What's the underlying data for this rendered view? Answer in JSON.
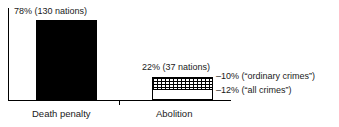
{
  "chart_data": {
    "type": "bar",
    "title": "",
    "subtitle": "",
    "xlabel": "",
    "ylabel": "",
    "ylim": [
      0,
      100
    ],
    "grid": false,
    "legend": "none",
    "categories": [
      "Death penalty",
      "Abolition"
    ],
    "values": [
      78,
      22
    ],
    "units": "percent",
    "series": [
      {
        "name": "Share of nations",
        "values": [
          78,
          22
        ],
        "counts": [
          130,
          37
        ],
        "data_labels": [
          "78% (130 nations)",
          "22% (37 nations)"
        ]
      }
    ],
    "segments": [
      {
        "category": "Abolition",
        "name": "ordinary crimes",
        "value": 10,
        "fill": "crosshatch",
        "annotation": "–10% (“ordinary crimes”)"
      },
      {
        "category": "Abolition",
        "name": "all crimes",
        "value": 12,
        "fill": "white",
        "annotation": "–12% (“all crimes”)"
      }
    ],
    "annotations": [
      "–10% (“ordinary crimes”)",
      "–12% (“all crimes”)"
    ],
    "colors": {
      "death_penalty_bar": "#000000",
      "abolition_bar_outline": "#000000",
      "abolition_bar_fill": "#ffffff",
      "axis": "#000000",
      "text": "#1a1a1a",
      "background": "#ffffff"
    }
  },
  "labels": {
    "death_value": "78% (130 nations)",
    "abolition_value": "22% (37 nations)",
    "category_death": "Death penalty",
    "category_abolition": "Abolition",
    "annotation_ordinary": "–10% (“ordinary crimes”)",
    "annotation_all": "–12% (“all crimes”)"
  }
}
